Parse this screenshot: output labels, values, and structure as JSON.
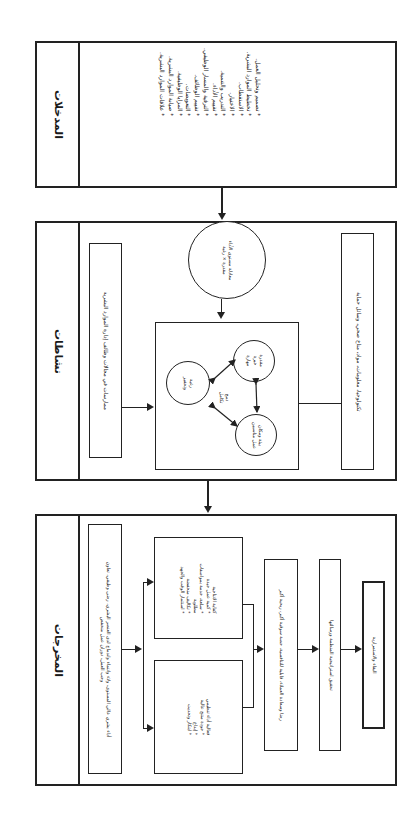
{
  "orientation": "rotated-90-clockwise",
  "inputs": {
    "title": "المدخلات",
    "items": [
      "تصميم وتحليل العمل.",
      "تخطيط الموارد البشرية.",
      "الاستقطاب.",
      "الاختيار.",
      "التدريب والتنمية.",
      "تقييم الأداء.",
      "الترقية والمسار الوظيفي.",
      "تقييم الوظائف.",
      "التعويضات.",
      "المزايا الوظيفية.",
      "صيانة الموارد البشرية.",
      "علاقات الموارد البشرية."
    ]
  },
  "activities": {
    "title": "نشاطات",
    "practices": "ممارسات في مجالات وظائف إدارة الموارد البشرية",
    "equation_circle": {
      "line1": "معادلة مستوى الأداء",
      "line2": "مقدرة × رغبة"
    },
    "integration_label": {
      "line1": "دمج",
      "line2": "تكامل"
    },
    "circles": {
      "desire": {
        "line1": "رغبة",
        "line2": "وتحفيز"
      },
      "ability": {
        "line1": "مقدرة",
        "line2": "خبرة",
        "line3": "مهارة"
      },
      "environment": {
        "line1": "بيئة ومكان",
        "line2": "عمل مناسبين"
      }
    },
    "resources": "تكنولوجيا، معلومات، مواد، مناخ صحي، وسائل حماية"
  },
  "outputs": {
    "title": "المخرجات",
    "human_performance": {
      "line1": "أداء بشري عالي المستوى، ولاء وانتماء واندماج لدى العنصر البشري، رضى وظيفي، تعاون",
      "line2": "وحب العمل، دوران عمل منخفض"
    },
    "efficiency": {
      "title": "كفاية الانتاجية",
      "items": [
        "كمية عمل جيدة",
        "سلعة، خدمة بمواصفات",
        "مطلوبة",
        "تكاليف منخفضة",
        "استثمار الوقت والجهد"
      ]
    },
    "effectiveness": {
      "title": "فعالية أداء تنظيمي",
      "items": [
        "جودة منتج عالية",
        "إبداع",
        "ابتكار وتحديث"
      ]
    },
    "customer_satisfaction": "رضا وسعادة العملاء، قابلية للتنافسية، حصة سوقية أكبر، ربحية أكبر",
    "strategy": "تحقيق استراتيجية المنظمة ورسالتها",
    "survival": "البقاء والاستمرارية"
  }
}
